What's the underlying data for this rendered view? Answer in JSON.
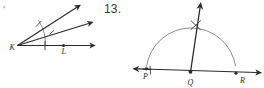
{
  "page": {
    "background_color": "#ffffff",
    "ink_color": "#2b2b2b",
    "arc_color": "#6e6e6e",
    "width": 264,
    "height": 88
  },
  "problem": {
    "number_label": "13."
  },
  "figures": [
    {
      "id": "figure-left",
      "kind": "angle-bisector-construction",
      "vertex_label": "K",
      "point_labels": [
        "K",
        "L"
      ],
      "ray_count": 3,
      "has_construction_arc": true,
      "tick_marks": 3,
      "labels": {
        "vertex": "K",
        "base_point": "L"
      }
    },
    {
      "id": "figure-right",
      "kind": "perpendicular-bisector-construction",
      "vertex_label": "Q",
      "point_labels": [
        "P",
        "Q",
        "R"
      ],
      "has_semicircle_arc": true,
      "has_cross_mark": true,
      "labels": {
        "left": "P",
        "vertex": "Q",
        "right": "R"
      }
    }
  ]
}
